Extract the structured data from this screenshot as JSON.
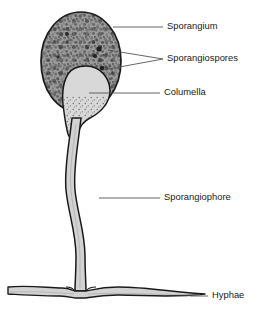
{
  "figure": {
    "background_color": "#ffffff",
    "line_color": "#1a1a1a",
    "leader_color": "#555555",
    "text_color": "#1a1a1a"
  },
  "labels": [
    {
      "id": "sporangium",
      "text": "Sporangium",
      "text_x": 167,
      "text_y": 27,
      "leader": "M 113 27 L 163 27",
      "target": "outer speckled spore case"
    },
    {
      "id": "sporangiospores",
      "text": "Sporangiospores",
      "text_x": 167,
      "text_y": 59,
      "leader": "M 108 50 L 163 59 M 103 70 L 163 59",
      "target": "dark spores inside case"
    },
    {
      "id": "columella",
      "text": "Columella",
      "text_x": 164,
      "text_y": 93,
      "leader": "M 89 93 L 160 93",
      "target": "central light bulb"
    },
    {
      "id": "sporangiophore",
      "text": "Sporangiophore",
      "text_x": 164,
      "text_y": 198,
      "leader": "M 99 198 L 160 198",
      "target": "vertical supporting stalk"
    },
    {
      "id": "hyphae",
      "text": "Hyphae",
      "text_x": 212,
      "text_y": 296,
      "leader": "M 190 296 L 208 296",
      "target": "horizontal basal filament"
    }
  ],
  "structures": {
    "sporangium": {
      "name": "sporangium-head",
      "fill_color": "#9a9a9a",
      "stroke_color": "#1a1a1a",
      "stroke_width": 1.6,
      "center_x": 81,
      "center_y": 62,
      "radius_x": 40,
      "radius_y": 50
    },
    "columella": {
      "name": "columella-bulb",
      "fill_color": "#d6d6d6",
      "stroke_color": "#1a1a1a",
      "stroke_width": 1.4
    },
    "sporangiophore": {
      "name": "sporangiophore-stalk",
      "fill_color": "#d2d2d2",
      "stroke_color": "#1a1a1a",
      "stroke_width": 1.5,
      "top_y": 112,
      "bottom_y": 292
    },
    "hyphae": {
      "name": "hyphae-filament",
      "fill_color": "#d2d2d2",
      "stroke_color": "#1a1a1a",
      "stroke_width": 1.4,
      "left_x": 8,
      "right_x": 205,
      "center_y": 292
    }
  }
}
